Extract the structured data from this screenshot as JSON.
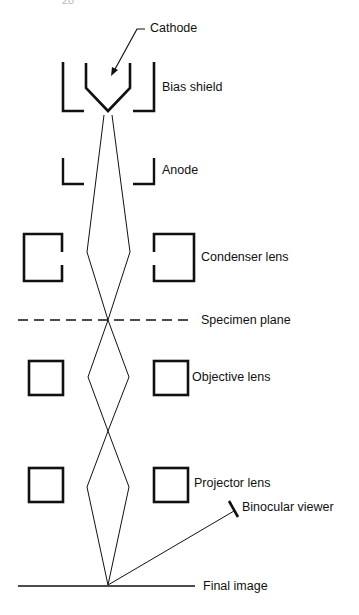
{
  "page": {
    "number": "28"
  },
  "diagram": {
    "labels": {
      "cathode": "Cathode",
      "bias_shield": "Bias shield",
      "anode": "Anode",
      "condenser_lens": "Condenser lens",
      "specimen_plane": "Specimen plane",
      "objective_lens": "Objective lens",
      "projector_lens": "Projector lens",
      "binocular_viewer": "Binocular viewer",
      "final_image": "Final image"
    },
    "colors": {
      "line": "#111111",
      "background": "#ffffff"
    }
  }
}
